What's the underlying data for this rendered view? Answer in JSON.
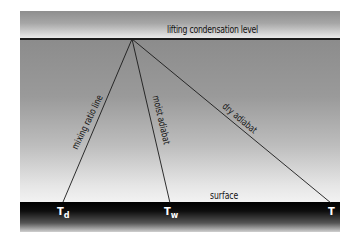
{
  "diagram": {
    "levels": {
      "top": "lifting condensation level",
      "bottom": "surface"
    },
    "lines": [
      {
        "label": "mixing ratio line",
        "from": "apex",
        "to": "Td"
      },
      {
        "label": "moist adiabat",
        "from": "apex",
        "to": "Tw"
      },
      {
        "label": "dry adiabat",
        "from": "apex",
        "to": "T"
      }
    ],
    "surface_points": {
      "td": {
        "main": "T",
        "sub": "d"
      },
      "tw": {
        "main": "T",
        "sub": "w"
      },
      "t": {
        "main": "T",
        "sub": ""
      }
    },
    "colors": {
      "line": "#1a1a1a",
      "surface_band": "#000000",
      "label_on_dark": "#ffffff"
    }
  }
}
